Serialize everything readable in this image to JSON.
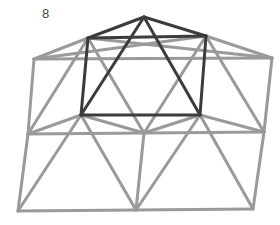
{
  "figure": {
    "label": "8",
    "colors": {
      "light": "#9a9a9a",
      "dark": "#3c3c3c",
      "background": "#ffffff"
    },
    "vertices": {
      "apex": [
        144,
        17
      ],
      "inner_top_left": [
        88,
        38
      ],
      "inner_top_right": [
        206,
        36
      ],
      "outer_top_left": [
        34,
        59
      ],
      "outer_top_right": [
        272,
        58
      ],
      "inner_bottom_left": [
        81,
        115
      ],
      "inner_bottom_right": [
        200,
        115
      ],
      "mid_left": [
        28,
        134
      ],
      "mid_center": [
        144,
        133
      ],
      "mid_right": [
        264,
        132
      ],
      "bottom_left": [
        18,
        211
      ],
      "bottom_center": [
        136,
        210
      ],
      "bottom_right": [
        253,
        209
      ]
    },
    "light_edges": [
      [
        "outer_top_left",
        "inner_top_left"
      ],
      [
        "inner_top_right",
        "outer_top_right"
      ],
      [
        "outer_top_left",
        "outer_top_right"
      ],
      [
        "outer_top_left",
        "mid_left"
      ],
      [
        "outer_top_right",
        "mid_right"
      ],
      [
        "inner_top_left",
        "mid_left"
      ],
      [
        "inner_top_left",
        "mid_center"
      ],
      [
        "inner_top_left",
        "outer_top_right"
      ],
      [
        "inner_top_right",
        "outer_top_left"
      ],
      [
        "inner_top_right",
        "mid_center"
      ],
      [
        "inner_top_right",
        "mid_right"
      ],
      [
        "mid_left",
        "inner_bottom_left"
      ],
      [
        "inner_bottom_left",
        "mid_center"
      ],
      [
        "mid_center",
        "inner_bottom_right"
      ],
      [
        "inner_bottom_right",
        "mid_right"
      ],
      [
        "mid_left",
        "mid_right"
      ],
      [
        "mid_left",
        "bottom_left"
      ],
      [
        "mid_right",
        "bottom_right"
      ],
      [
        "bottom_left",
        "bottom_right"
      ],
      [
        "inner_bottom_left",
        "bottom_left"
      ],
      [
        "inner_bottom_left",
        "bottom_center"
      ],
      [
        "mid_center",
        "bottom_center"
      ],
      [
        "inner_bottom_right",
        "bottom_center"
      ],
      [
        "inner_bottom_right",
        "bottom_right"
      ]
    ],
    "dark_edges": [
      [
        "apex",
        "inner_top_left"
      ],
      [
        "apex",
        "inner_top_right"
      ],
      [
        "inner_top_left",
        "inner_top_right"
      ],
      [
        "inner_top_left",
        "inner_bottom_left"
      ],
      [
        "inner_top_right",
        "inner_bottom_right"
      ],
      [
        "inner_bottom_left",
        "inner_bottom_right"
      ],
      [
        "apex",
        "inner_bottom_left"
      ],
      [
        "apex",
        "inner_bottom_right"
      ]
    ]
  }
}
